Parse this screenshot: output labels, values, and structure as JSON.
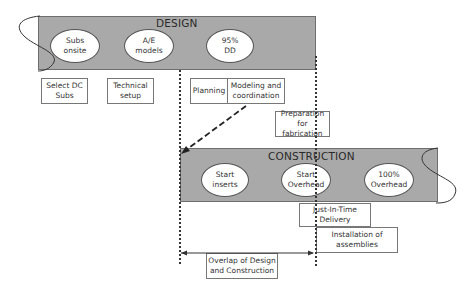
{
  "design": {
    "title": "DESIGN",
    "milestones": [
      {
        "label": "Subs onsite"
      },
      {
        "label": "A/E models"
      },
      {
        "label": "95% DD"
      }
    ],
    "activities": [
      {
        "label": "Select DC Subs"
      },
      {
        "label": "Technical setup"
      },
      {
        "label": "Planning"
      },
      {
        "label": "Modeling and coordination"
      },
      {
        "label": "Preparation for fabrication"
      }
    ]
  },
  "construction": {
    "title": "CONSTRUCTION",
    "milestones": [
      {
        "label": "Start inserts"
      },
      {
        "label": "Start Overhead"
      },
      {
        "label": "100% Overhead"
      }
    ],
    "activities": [
      {
        "label": "Just-In-Time Delivery"
      },
      {
        "label": "Installation of assemblies"
      }
    ]
  },
  "overlap": {
    "label": "Overlap of Design and Construction"
  },
  "colors": {
    "band_fill": "#a9a9a9",
    "band_border": "#6e6e6e",
    "line": "#333333"
  }
}
